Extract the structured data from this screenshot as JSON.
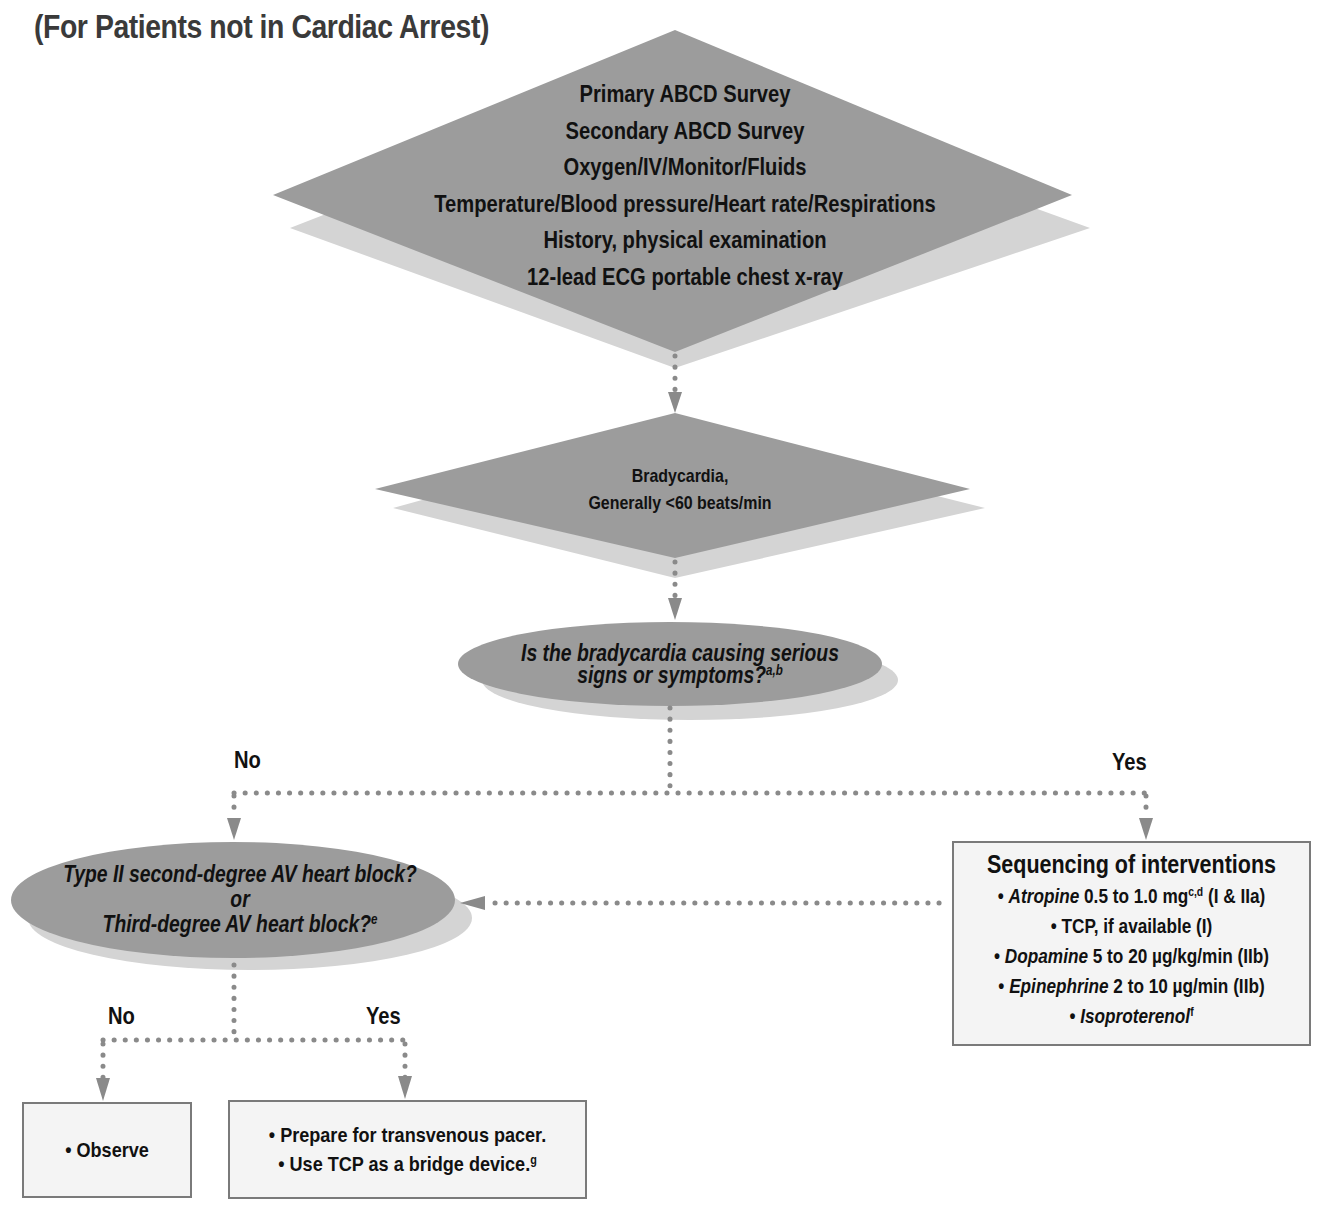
{
  "title": "(For Patients not in Cardiac Arrest)",
  "colors": {
    "shape_fill": "#9c9c9c",
    "shape_shadow": "#d2d2d2",
    "connector": "#8a8a8a",
    "box_fill": "#f4f4f4",
    "box_border": "#7a7a7a",
    "text": "#111111",
    "title_text": "#3a3a3a"
  },
  "nodes": {
    "assessment": {
      "shape": "diamond",
      "lines": [
        "Primary ABCD Survey",
        "Secondary ABCD Survey",
        "Oxygen/IV/Monitor/Fluids",
        "Temperature/Blood pressure/Heart rate/Respirations",
        "History, physical examination",
        "12-lead ECG portable chest x-ray"
      ]
    },
    "bradycardia": {
      "shape": "diamond",
      "lines": [
        "Bradycardia,",
        "Generally <60 beats/min"
      ]
    },
    "serious_signs": {
      "shape": "ellipse",
      "line1": "Is the bradycardia causing serious",
      "line2": "signs or symptoms?",
      "footnote": "a,b"
    },
    "av_block": {
      "shape": "ellipse",
      "line1": "Type II second-degree AV heart block?",
      "line2": "or",
      "line3": "Third-degree AV heart block?",
      "footnote": "e"
    },
    "interventions": {
      "shape": "box",
      "title": "Sequencing of interventions",
      "items": [
        {
          "drug": "Atropine",
          "text": " 0.5 to 1.0 mg",
          "footnote": "c,d",
          "suffix": " (I & IIa)"
        },
        {
          "drug": "",
          "text": "TCP, if available (I)",
          "footnote": "",
          "suffix": ""
        },
        {
          "drug": "Dopamine",
          "text": " 5 to 20 µg/kg/min (IIb)",
          "footnote": "",
          "suffix": ""
        },
        {
          "drug": "Epinephrine",
          "text": " 2 to 10 µg/min (IIb)",
          "footnote": "",
          "suffix": ""
        },
        {
          "drug": "Isoproterenol",
          "text": "",
          "footnote": "f",
          "suffix": ""
        }
      ],
      "bullet": "•"
    },
    "observe": {
      "shape": "box",
      "items": [
        "Observe"
      ],
      "bullet": "•"
    },
    "pacer": {
      "shape": "box",
      "items": [
        "Prepare for transvenous pacer.",
        "Use TCP as a bridge device."
      ],
      "footnote": "g",
      "bullet": "•"
    }
  },
  "edge_labels": {
    "serious_no": "No",
    "serious_yes": "Yes",
    "block_no": "No",
    "block_yes": "Yes"
  },
  "edges": [
    {
      "from": "assessment",
      "to": "bradycardia",
      "style": "dotted-arrow"
    },
    {
      "from": "bradycardia",
      "to": "serious_signs",
      "style": "dotted-arrow"
    },
    {
      "from": "serious_signs",
      "to": "av_block",
      "label": "No",
      "style": "dotted-arrow"
    },
    {
      "from": "serious_signs",
      "to": "interventions",
      "label": "Yes",
      "style": "dotted-arrow"
    },
    {
      "from": "interventions",
      "to": "av_block",
      "style": "dotted-arrow"
    },
    {
      "from": "av_block",
      "to": "observe",
      "label": "No",
      "style": "dotted-arrow"
    },
    {
      "from": "av_block",
      "to": "pacer",
      "label": "Yes",
      "style": "dotted-arrow"
    }
  ]
}
